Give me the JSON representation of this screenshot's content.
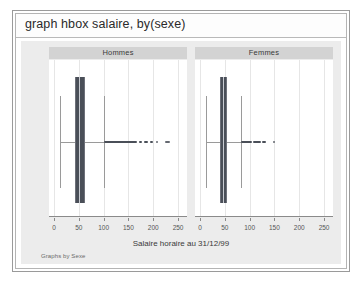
{
  "window": {
    "command_line": "graph hbox salaire, by(sexe)"
  },
  "chart_data": {
    "type": "box",
    "title": "",
    "xlabel": "Salaire horaire au 31/12/99",
    "ylabel": "",
    "note": "Graphs by Sexe",
    "grid": true,
    "legend_position": "none",
    "xlim": [
      -10,
      268
    ],
    "xticks": [
      0,
      50,
      100,
      150,
      200,
      250
    ],
    "xticklabels": [
      "0",
      "50",
      "100",
      "150",
      "200",
      "250"
    ],
    "panels": [
      {
        "label": "Hommes",
        "stats": {
          "lower_whisker": 13,
          "q1": 43,
          "median": 50,
          "q3": 62,
          "upper_whisker": 100
        },
        "outlier_clusters": [
          {
            "from": 100,
            "to": 168,
            "density": "dense"
          },
          {
            "from": 172,
            "to": 178,
            "density": "dense"
          },
          {
            "from": 182,
            "to": 190,
            "density": "dense"
          },
          {
            "from": 194,
            "to": 200,
            "density": "dense"
          },
          {
            "from": 206,
            "to": 210,
            "density": "sparse"
          },
          {
            "from": 224,
            "to": 234,
            "density": "sparse"
          }
        ]
      },
      {
        "label": "Femmes",
        "stats": {
          "lower_whisker": 13,
          "q1": 41,
          "median": 47,
          "q3": 54,
          "upper_whisker": 82
        },
        "outlier_clusters": [
          {
            "from": 82,
            "to": 104,
            "density": "dense"
          },
          {
            "from": 106,
            "to": 122,
            "density": "dense"
          },
          {
            "from": 124,
            "to": 134,
            "density": "dense"
          },
          {
            "from": 148,
            "to": 151,
            "density": "sparse"
          }
        ]
      }
    ]
  },
  "colors": {
    "box_fill": "#4a4f58",
    "median": "#c9ccd2",
    "whisker": "#9a9a9a",
    "panel_header": "#d3d3d3",
    "graph_background": "#ececec",
    "plot_background": "#ffffff",
    "gridline": "#e6e6e6"
  }
}
